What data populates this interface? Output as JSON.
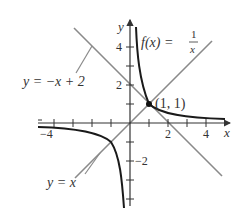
{
  "figure": {
    "axes": {
      "x_label": "x",
      "y_label": "y",
      "x_tick_labels": [
        "−4",
        "2",
        "4"
      ],
      "y_tick_labels": [
        "4",
        "2",
        "−2"
      ],
      "xlim": [
        -5.5,
        4.5
      ],
      "ylim": [
        -4.2,
        5.2
      ]
    },
    "curves": [
      {
        "name": "f(x) = 1/x",
        "label_lhs": "f(x) =",
        "label_num": "1",
        "label_den": "x",
        "color": "#1a1a1a"
      },
      {
        "name": "y = x",
        "label": "y = x",
        "color": "#8a8a8a"
      },
      {
        "name": "y = −x + 2",
        "label": "y = −x + 2",
        "color": "#8a8a8a"
      }
    ],
    "point": {
      "label": "(1, 1)",
      "x": 1,
      "y": 1
    }
  }
}
